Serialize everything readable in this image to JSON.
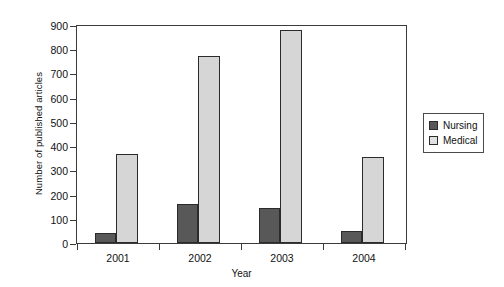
{
  "chart_data": {
    "type": "bar",
    "title": "",
    "xlabel": "Year",
    "ylabel": "Number of published articles",
    "categories": [
      "2001",
      "2002",
      "2003",
      "2004"
    ],
    "series": [
      {
        "name": "Nursing",
        "color": "#585858",
        "values": [
          40,
          160,
          145,
          50
        ]
      },
      {
        "name": "Medical",
        "color": "#d6d6d6",
        "values": [
          370,
          775,
          885,
          355
        ]
      }
    ],
    "ylim": [
      0,
      900
    ],
    "yticks": [
      0,
      100,
      200,
      300,
      400,
      500,
      600,
      700,
      800,
      900
    ],
    "ytick_labels": [
      "0",
      "100",
      "200",
      "300",
      "400",
      "500",
      "600",
      "700",
      "800",
      "900"
    ],
    "grid": false,
    "legend_position": "right",
    "legend_entries": [
      "Nursing",
      "Medical"
    ]
  }
}
